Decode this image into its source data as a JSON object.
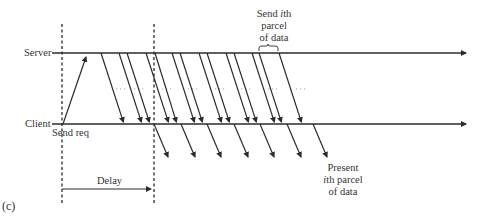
{
  "figure": {
    "panel_label": "(c)",
    "timelines": [
      {
        "name": "Server",
        "y": 53
      },
      {
        "name": "Client",
        "y": 124
      }
    ],
    "labels": {
      "server": "Server",
      "client": "Client",
      "send_req": "Send req",
      "delay": "Delay",
      "send_parcel_line1_pre": "Send ",
      "send_parcel_line1_i": "i",
      "send_parcel_line1_post": "th",
      "send_parcel_line2": "parcel",
      "send_parcel_line3": "of data",
      "present_line1": "Present",
      "present_line2_i": "i",
      "present_line2_post": "th parcel",
      "present_line3": "of data"
    },
    "request_arrow": {
      "from": [
        63,
        124
      ],
      "to": [
        87,
        54
      ]
    },
    "server_to_client_arrows": [
      {
        "from": 101,
        "to": 124
      },
      {
        "from": 119,
        "to": 142
      },
      {
        "from": 127,
        "to": 150
      },
      {
        "from": 146,
        "to": 169
      },
      {
        "from": 155,
        "to": 177
      },
      {
        "from": 172,
        "to": 195
      },
      {
        "from": 180,
        "to": 203
      },
      {
        "from": 199,
        "to": 222
      },
      {
        "from": 207,
        "to": 230
      },
      {
        "from": 226,
        "to": 249
      },
      {
        "from": 234,
        "to": 257
      },
      {
        "from": 252,
        "to": 275
      },
      {
        "from": 259,
        "to": 282
      },
      {
        "from": 279,
        "to": 302
      }
    ],
    "client_to_present_arrows": [
      {
        "from": 154,
        "to": 168
      },
      {
        "from": 181,
        "to": 195
      },
      {
        "from": 207,
        "to": 221
      },
      {
        "from": 234,
        "to": 248
      },
      {
        "from": 260,
        "to": 274
      },
      {
        "from": 287,
        "to": 301
      },
      {
        "from": 313,
        "to": 327
      }
    ],
    "dashed_verticals": [
      62,
      154
    ],
    "dotted_segments": [
      [
        116,
        126
      ],
      [
        134,
        146
      ],
      [
        162,
        173
      ],
      [
        188,
        200
      ],
      [
        215,
        226
      ],
      [
        241,
        253
      ],
      [
        268,
        278
      ],
      [
        296,
        308
      ]
    ],
    "colors": {
      "line": "#2b2b2b",
      "dotted": "#9a9a9a",
      "text": "#333333"
    }
  }
}
